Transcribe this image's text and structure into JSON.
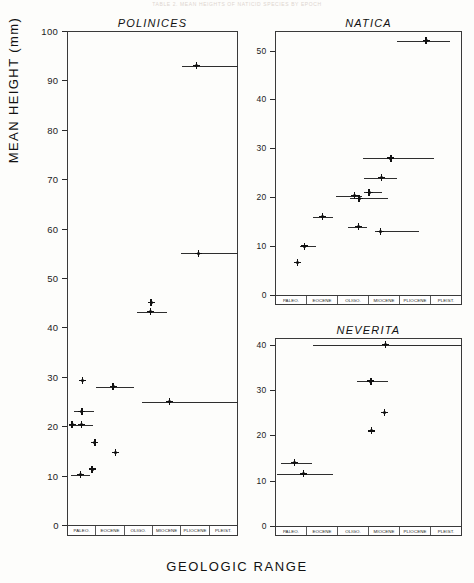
{
  "figure": {
    "faint_header": "TABLE 2. MEAN HEIGHTS OF NATICID SPECIES BY EPOCH",
    "xlabel": "GEOLOGIC RANGE",
    "ylabel": "MEAN HEIGHT (mm)",
    "epochs": [
      "PALEO.",
      "EOCENE",
      "OLIGO.",
      "MIOCENE",
      "PLIOCENE",
      "PLEIST."
    ],
    "ink_color": "#111111",
    "axis_color": "#3a3a3a",
    "background": "#fdfdfb"
  },
  "chart_data": [
    {
      "type": "scatter",
      "title": "POLINICES",
      "xlabel": "GEOLOGIC RANGE",
      "ylabel": "MEAN HEIGHT (mm)",
      "ylim": [
        0,
        100
      ],
      "yticks": [
        0,
        10,
        20,
        30,
        40,
        50,
        60,
        70,
        80,
        90,
        100
      ],
      "xlim": [
        0,
        6
      ],
      "categories": [
        "PALEO.",
        "EOCENE",
        "OLIGO.",
        "MIOCENE",
        "PLIOCENE",
        "PLEIST."
      ],
      "grid": false,
      "legend": "none",
      "points": [
        {
          "x": 0.55,
          "y": 29.3,
          "range_start": null,
          "range_end": null
        },
        {
          "x": 0.52,
          "y": 23.0,
          "range_start": 0.25,
          "range_end": 0.95
        },
        {
          "x": 0.5,
          "y": 20.3,
          "range_start": 0.08,
          "range_end": 0.92
        },
        {
          "x": 0.18,
          "y": 20.3,
          "range_start": null,
          "range_end": null
        },
        {
          "x": 0.48,
          "y": 10.2,
          "range_start": 0.15,
          "range_end": 0.8
        },
        {
          "x": 0.88,
          "y": 11.3,
          "range_start": null,
          "range_end": null
        },
        {
          "x": 0.98,
          "y": 16.7,
          "range_start": null,
          "range_end": null
        },
        {
          "x": 1.7,
          "y": 14.7,
          "range_start": null,
          "range_end": null
        },
        {
          "x": 1.62,
          "y": 28.0,
          "range_start": 1.0,
          "range_end": 2.35
        },
        {
          "x": 2.95,
          "y": 45.0,
          "range_start": null,
          "range_end": null
        },
        {
          "x": 2.92,
          "y": 43.2,
          "range_start": 2.45,
          "range_end": 3.5
        },
        {
          "x": 3.6,
          "y": 25.0,
          "range_start": 2.62,
          "range_end": 6.0
        },
        {
          "x": 4.55,
          "y": 93.0,
          "range_start": 4.05,
          "range_end": 6.0
        },
        {
          "x": 4.62,
          "y": 55.0,
          "range_start": 4.0,
          "range_end": 6.0
        }
      ]
    },
    {
      "type": "scatter",
      "title": "NATICA",
      "xlabel": "GEOLOGIC RANGE",
      "ylabel": "MEAN HEIGHT (mm)",
      "ylim": [
        0,
        54
      ],
      "yticks": [
        0,
        10,
        20,
        30,
        40,
        50
      ],
      "xlim": [
        0,
        6
      ],
      "categories": [
        "PALEO.",
        "EOCENE",
        "OLIGO.",
        "MIOCENE",
        "PLIOCENE",
        "PLEIST."
      ],
      "grid": false,
      "legend": "none",
      "points": [
        {
          "x": 0.72,
          "y": 6.7,
          "range_start": null,
          "range_end": null
        },
        {
          "x": 0.95,
          "y": 10.0,
          "range_start": 0.8,
          "range_end": 1.3
        },
        {
          "x": 1.52,
          "y": 16.0,
          "range_start": 1.22,
          "range_end": 1.85
        },
        {
          "x": 2.55,
          "y": 20.3,
          "range_start": 1.95,
          "range_end": 2.8
        },
        {
          "x": 2.7,
          "y": 19.8,
          "range_start": 2.42,
          "range_end": 3.62
        },
        {
          "x": 3.02,
          "y": 21.0,
          "range_start": 2.85,
          "range_end": 3.42
        },
        {
          "x": 2.68,
          "y": 14.0,
          "range_start": 2.35,
          "range_end": 2.95
        },
        {
          "x": 3.42,
          "y": 24.0,
          "range_start": 2.85,
          "range_end": 3.9
        },
        {
          "x": 3.72,
          "y": 28.0,
          "range_start": 2.82,
          "range_end": 5.1
        },
        {
          "x": 3.38,
          "y": 13.0,
          "range_start": 3.22,
          "range_end": 4.62
        },
        {
          "x": 4.85,
          "y": 52.0,
          "range_start": 3.9,
          "range_end": 5.6
        }
      ]
    },
    {
      "type": "scatter",
      "title": "NEVERITA",
      "xlabel": "GEOLOGIC RANGE",
      "ylabel": "MEAN HEIGHT (mm)",
      "ylim": [
        0,
        41.5
      ],
      "yticks": [
        0,
        10,
        20,
        30,
        40
      ],
      "xlim": [
        0,
        6
      ],
      "categories": [
        "PALEO.",
        "EOCENE",
        "OLIGO.",
        "MIOCENE",
        "PLIOCENE",
        "PLEIST."
      ],
      "grid": false,
      "legend": "none",
      "points": [
        {
          "x": 0.62,
          "y": 14.0,
          "range_start": 0.18,
          "range_end": 1.18
        },
        {
          "x": 0.92,
          "y": 11.5,
          "range_start": 0.08,
          "range_end": 1.85
        },
        {
          "x": 3.1,
          "y": 21.0,
          "range_start": null,
          "range_end": null
        },
        {
          "x": 3.08,
          "y": 32.0,
          "range_start": 2.62,
          "range_end": 3.62
        },
        {
          "x": 3.52,
          "y": 25.0,
          "range_start": null,
          "range_end": null
        },
        {
          "x": 3.55,
          "y": 40.0,
          "range_start": 1.22,
          "range_end": 6.0
        }
      ]
    }
  ]
}
